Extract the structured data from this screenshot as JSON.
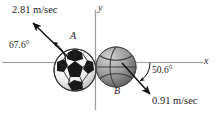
{
  "figure": {
    "axes": {
      "x_label": "x",
      "y_label": "y"
    },
    "bodies": [
      {
        "id": "A",
        "label": "A",
        "kind": "soccer-ball",
        "speed": "2.81 m/sec",
        "angle": "67.6°",
        "direction": "up-left"
      },
      {
        "id": "B",
        "label": "B",
        "kind": "basketball",
        "speed": "0.91 m/sec",
        "angle": "50.6°",
        "direction": "down-right"
      }
    ],
    "colors": {
      "axis": "#9a9a9a",
      "arrow": "#111111",
      "text": "#1a1a1a",
      "soccer_ball_light": "#f2f2f2",
      "soccer_ball_dark": "#1d1d1d",
      "basketball_mid": "#8d8d8d",
      "basketball_dark": "#4a4a4a",
      "basketball_light": "#c4c4c4"
    }
  }
}
